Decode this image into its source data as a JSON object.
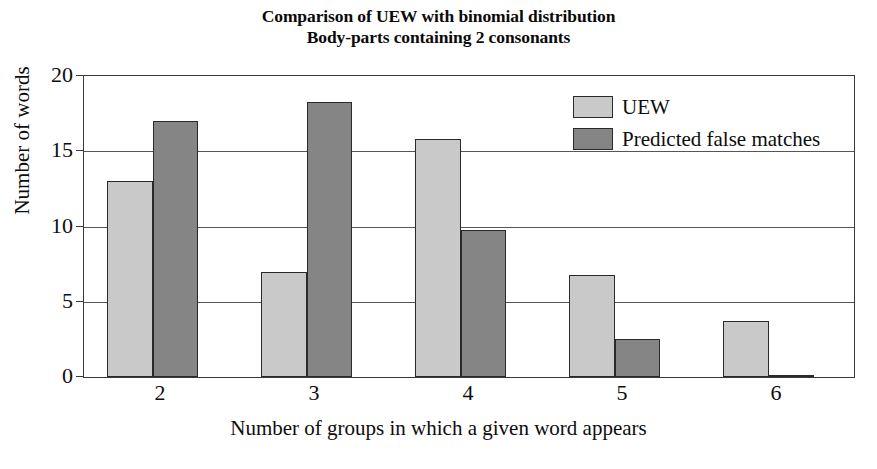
{
  "chart_data": {
    "type": "bar",
    "title": "Comparison of UEW with binomial distribution",
    "subtitle": "Body-parts containing 2 consonants",
    "title_lines": [
      "Comparison of UEW with binomial distribution",
      "Body-parts containing 2 consonants"
    ],
    "xlabel": "Number of groups in which a given word appears",
    "ylabel": "Number of words",
    "categories": [
      "2",
      "3",
      "4",
      "5",
      "6"
    ],
    "series": [
      {
        "name": "UEW",
        "color": "#c9c9c9",
        "values": [
          13.0,
          7.0,
          15.8,
          6.8,
          3.7
        ]
      },
      {
        "name": "Predicted false matches",
        "color": "#858585",
        "values": [
          17.0,
          18.3,
          9.8,
          2.5,
          0.15
        ]
      }
    ],
    "ylim": [
      0,
      20
    ],
    "yticks": [
      0,
      5,
      10,
      15,
      20
    ],
    "ytick_labels": [
      "0",
      "5",
      "10",
      "15",
      "20"
    ],
    "grid": true,
    "grid_axis": "y",
    "legend_position": "top-right",
    "frame": true,
    "bar_border_color": "#2a2a2a",
    "background_color": "#ffffff"
  },
  "legend": {
    "entries": [
      {
        "label": "UEW",
        "swatch": "light-gray"
      },
      {
        "label": "Predicted false matches",
        "swatch": "dark-gray"
      }
    ]
  }
}
